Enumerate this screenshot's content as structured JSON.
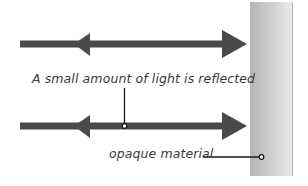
{
  "diagram": {
    "labels": {
      "reflection": "A small amount of light is reflected",
      "material": "opaque material"
    },
    "elements": {
      "upper_arrow": "double-headed arrow: incident light toward material, reflected light away",
      "lower_arrow": "double-headed arrow: incident light toward material, reflected light away",
      "material_block": "opaque material"
    },
    "colors": {
      "arrow": "#4a4a4a",
      "leader_line": "#1a1a1a",
      "material_dark": "#b4b4b4",
      "material_light": "#ececec",
      "text": "#3a3a3a"
    }
  }
}
